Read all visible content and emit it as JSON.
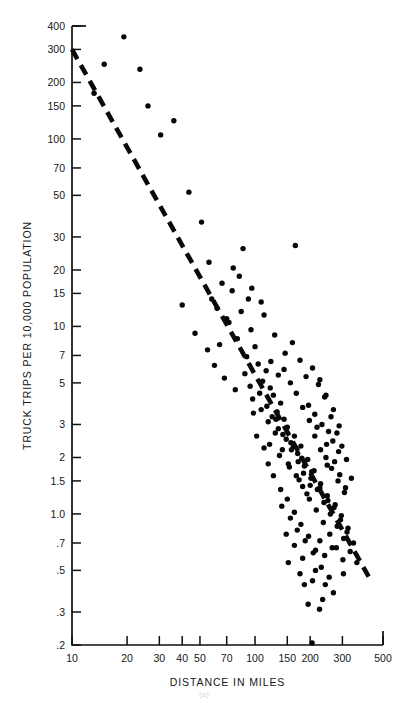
{
  "figure": {
    "caption": "(a)"
  },
  "chart_data": {
    "type": "scatter",
    "title": "",
    "xlabel": "DISTANCE IN MILES",
    "ylabel": "TRUCK TRIPS PER 10,000 POPULATION",
    "xscale": "log",
    "yscale": "log",
    "xlim": [
      10,
      500
    ],
    "ylim": [
      0.2,
      400
    ],
    "grid": false,
    "legend": null,
    "xticks": [
      10,
      20,
      30,
      40,
      50,
      70,
      100,
      150,
      200,
      300,
      500
    ],
    "xtick_labels": [
      "10",
      "20",
      "30",
      "40",
      "50",
      "70",
      "100",
      "150",
      "200",
      "300",
      "500"
    ],
    "yticks": [
      0.2,
      0.3,
      0.5,
      0.7,
      1.0,
      1.5,
      2,
      3,
      5,
      7,
      10,
      15,
      20,
      30,
      50,
      70,
      100,
      150,
      200,
      300,
      400
    ],
    "ytick_labels": [
      ".2",
      ".3",
      ".5",
      ".7",
      "1.0",
      "1.5",
      "2",
      "3",
      "5",
      "7",
      "10",
      "15",
      "20",
      "30",
      "50",
      "70",
      "100",
      "150",
      "200",
      "300",
      "400"
    ],
    "marker": "circle",
    "marker_color": "#070707",
    "trendline": {
      "style": "dashed",
      "color": "#0a0a0a",
      "x_start": 10,
      "y_start": 300,
      "x_end": 430,
      "y_end": 0.44
    },
    "points": [
      [
        19.2,
        350
      ],
      [
        15.0,
        250
      ],
      [
        13.2,
        175
      ],
      [
        23.5,
        235
      ],
      [
        30.5,
        105
      ],
      [
        36.0,
        125
      ],
      [
        26.0,
        150
      ],
      [
        43.5,
        52
      ],
      [
        40.0,
        13.0
      ],
      [
        51.0,
        36.0
      ],
      [
        56.0,
        22.0
      ],
      [
        47.0,
        9.2
      ],
      [
        62.0,
        12.5
      ],
      [
        55.0,
        7.5
      ],
      [
        66.0,
        17.0
      ],
      [
        72.0,
        10.5
      ],
      [
        60.0,
        6.2
      ],
      [
        75.0,
        15.5
      ],
      [
        80.0,
        8.6
      ],
      [
        68.0,
        5.3
      ],
      [
        84.0,
        12.0
      ],
      [
        90.0,
        6.9
      ],
      [
        78.0,
        4.6
      ],
      [
        95.0,
        9.6
      ],
      [
        100.0,
        7.8
      ],
      [
        88.0,
        5.6
      ],
      [
        104.0,
        6.3
      ],
      [
        110.0,
        5.1
      ],
      [
        97.0,
        4.1
      ],
      [
        115.0,
        5.8
      ],
      [
        121.0,
        4.7
      ],
      [
        108.0,
        3.6
      ],
      [
        126.0,
        4.3
      ],
      [
        132.0,
        3.5
      ],
      [
        118.0,
        3.1
      ],
      [
        138.0,
        3.9
      ],
      [
        144.0,
        3.2
      ],
      [
        129.0,
        2.7
      ],
      [
        150.0,
        2.9
      ],
      [
        157.0,
        2.4
      ],
      [
        141.0,
        2.2
      ],
      [
        164.0,
        2.6
      ],
      [
        171.0,
        2.1
      ],
      [
        152.0,
        1.85
      ],
      [
        178.0,
        2.3
      ],
      [
        186.0,
        1.8
      ],
      [
        168.0,
        1.6
      ],
      [
        194.0,
        1.95
      ],
      [
        202.0,
        1.55
      ],
      [
        182.0,
        1.4
      ],
      [
        210.0,
        1.7
      ],
      [
        219.0,
        1.35
      ],
      [
        198.0,
        1.2
      ],
      [
        228.0,
        1.45
      ],
      [
        238.0,
        1.15
      ],
      [
        216.0,
        1.05
      ],
      [
        248.0,
        1.25
      ],
      [
        258.0,
        1.0
      ],
      [
        236.0,
        0.9
      ],
      [
        270.0,
        1.08
      ],
      [
        281.0,
        0.86
      ],
      [
        256.0,
        0.78
      ],
      [
        293.0,
        0.93
      ],
      [
        305.0,
        0.74
      ],
      [
        278.0,
        0.66
      ],
      [
        318.0,
        0.8
      ],
      [
        331.0,
        0.63
      ],
      [
        302.0,
        0.57
      ],
      [
        345.0,
        0.7
      ],
      [
        360.0,
        0.55
      ],
      [
        86.0,
        26.0
      ],
      [
        166.0,
        27.0
      ],
      [
        92.0,
        14.0
      ],
      [
        112.0,
        11.5
      ],
      [
        128.0,
        9.0
      ],
      [
        146.0,
        7.2
      ],
      [
        160.0,
        8.2
      ],
      [
        176.0,
        6.6
      ],
      [
        190.0,
        5.4
      ],
      [
        206.0,
        6.0
      ],
      [
        222.0,
        4.9
      ],
      [
        240.0,
        4.2
      ],
      [
        196.0,
        3.8
      ],
      [
        212.0,
        3.4
      ],
      [
        232.0,
        3.0
      ],
      [
        252.0,
        2.75
      ],
      [
        266.0,
        2.45
      ],
      [
        286.0,
        2.15
      ],
      [
        244.0,
        2.0
      ],
      [
        262.0,
        1.75
      ],
      [
        284.0,
        1.5
      ],
      [
        308.0,
        1.3
      ],
      [
        274.0,
        1.12
      ],
      [
        296.0,
        0.98
      ],
      [
        322.0,
        0.84
      ],
      [
        124.0,
        3.3
      ],
      [
        134.0,
        2.85
      ],
      [
        148.0,
        2.5
      ],
      [
        158.0,
        2.2
      ],
      [
        172.0,
        1.9
      ],
      [
        184.0,
        1.65
      ],
      [
        200.0,
        1.42
      ],
      [
        120.0,
        2.35
      ],
      [
        136.0,
        2.05
      ],
      [
        154.0,
        1.78
      ],
      [
        174.0,
        1.52
      ],
      [
        192.0,
        1.28
      ],
      [
        106.0,
        4.4
      ],
      [
        116.0,
        3.75
      ],
      [
        130.0,
        3.2
      ],
      [
        142.0,
        2.65
      ],
      [
        162.0,
        2.3
      ],
      [
        180.0,
        1.98
      ],
      [
        204.0,
        1.68
      ],
      [
        226.0,
        1.38
      ],
      [
        250.0,
        1.18
      ],
      [
        140.0,
        1.1
      ],
      [
        156.0,
        0.95
      ],
      [
        170.0,
        0.82
      ],
      [
        188.0,
        0.72
      ],
      [
        208.0,
        0.62
      ],
      [
        230.0,
        0.52
      ],
      [
        254.0,
        0.46
      ],
      [
        148.0,
        0.78
      ],
      [
        164.0,
        0.68
      ],
      [
        182.0,
        0.58
      ],
      [
        214.0,
        0.5
      ],
      [
        242.0,
        0.42
      ],
      [
        268.0,
        0.38
      ],
      [
        195.0,
        0.33
      ],
      [
        225.0,
        0.31
      ],
      [
        205.0,
        0.205
      ],
      [
        234.0,
        0.35
      ],
      [
        102.0,
        2.6
      ],
      [
        112.0,
        2.25
      ],
      [
        98.0,
        3.45
      ],
      [
        94.0,
        4.8
      ],
      [
        218.0,
        2.9
      ],
      [
        246.0,
        2.35
      ],
      [
        272.0,
        1.9
      ],
      [
        290.0,
        1.62
      ],
      [
        312.0,
        1.38
      ],
      [
        260.0,
        3.3
      ],
      [
        280.0,
        2.7
      ],
      [
        298.0,
        2.3
      ],
      [
        316.0,
        1.95
      ],
      [
        336.0,
        1.55
      ],
      [
        226.0,
        5.2
      ],
      [
        244.0,
        4.3
      ],
      [
        268.0,
        3.6
      ],
      [
        288.0,
        2.95
      ],
      [
        226.0,
        0.72
      ],
      [
        186.0,
        0.42
      ],
      [
        176.0,
        0.48
      ],
      [
        152.0,
        0.55
      ],
      [
        206.0,
        0.44
      ],
      [
        264.0,
        0.66
      ],
      [
        240.0,
        0.6
      ],
      [
        304.0,
        0.48
      ],
      [
        118.0,
        1.85
      ],
      [
        126.0,
        1.6
      ],
      [
        138.0,
        1.35
      ],
      [
        150.0,
        1.2
      ],
      [
        164.0,
        1.02
      ],
      [
        178.0,
        0.88
      ],
      [
        196.0,
        0.76
      ],
      [
        214.0,
        0.64
      ],
      [
        144.0,
        5.9
      ],
      [
        156.0,
        5.0
      ],
      [
        168.0,
        4.4
      ],
      [
        182.0,
        3.7
      ],
      [
        198.0,
        3.15
      ],
      [
        212.0,
        2.6
      ],
      [
        228.0,
        2.2
      ],
      [
        248.0,
        1.82
      ],
      [
        82.0,
        18.5
      ],
      [
        96.0,
        16.0
      ],
      [
        108.0,
        13.5
      ],
      [
        76.0,
        20.5
      ],
      [
        70.0,
        11.0
      ],
      [
        64.0,
        8.0
      ],
      [
        58.0,
        14.0
      ],
      [
        122.0,
        6.5
      ],
      [
        134.0,
        5.5
      ]
    ]
  }
}
